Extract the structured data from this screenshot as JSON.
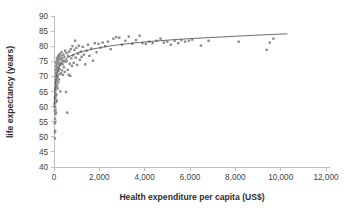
{
  "chart_data": {
    "type": "scatter",
    "title": "",
    "subtitle": "",
    "xlabel": "Health expenditure per capita (US$)",
    "ylabel": "life expectancy (years)",
    "xlim": [
      0,
      12000
    ],
    "ylim": [
      40,
      90
    ],
    "x_ticks": [
      0,
      2000,
      4000,
      6000,
      8000,
      10000,
      12000
    ],
    "x_tick_labels": [
      "0",
      "2,000",
      "4,000",
      "6,000",
      "8,000",
      "10,000",
      "12,000"
    ],
    "y_ticks": [
      40,
      45,
      50,
      55,
      60,
      65,
      70,
      75,
      80,
      85,
      90
    ],
    "y_tick_labels": [
      "40",
      "45",
      "50",
      "55",
      "60",
      "65",
      "70",
      "75",
      "80",
      "85",
      "90"
    ],
    "grid": false,
    "legend": false,
    "legend_position": "none",
    "marker_color": "#8c8c8c",
    "marker_shape": "square",
    "trend_color": "#595959",
    "trend_type": "logarithmic",
    "background_color": "#ffffff",
    "axis_color": "#bfbfbf",
    "series": [
      {
        "name": "countries",
        "points": [
          [
            30,
            61.0
          ],
          [
            32,
            58.5
          ],
          [
            35,
            54.5
          ],
          [
            38,
            63.0
          ],
          [
            40,
            51.5
          ],
          [
            42,
            49.5
          ],
          [
            45,
            56.0
          ],
          [
            48,
            66.0
          ],
          [
            50,
            52.0
          ],
          [
            52,
            60.0
          ],
          [
            55,
            64.5
          ],
          [
            58,
            57.5
          ],
          [
            60,
            68.0
          ],
          [
            62,
            55.0
          ],
          [
            65,
            62.5
          ],
          [
            68,
            70.0
          ],
          [
            70,
            59.0
          ],
          [
            72,
            65.5
          ],
          [
            75,
            72.0
          ],
          [
            78,
            63.5
          ],
          [
            80,
            67.5
          ],
          [
            84,
            71.0
          ],
          [
            86,
            58.0
          ],
          [
            90,
            73.5
          ],
          [
            92,
            61.5
          ],
          [
            95,
            69.0
          ],
          [
            98,
            74.5
          ],
          [
            100,
            66.5
          ],
          [
            105,
            72.5
          ],
          [
            108,
            64.0
          ],
          [
            112,
            70.5
          ],
          [
            115,
            75.0
          ],
          [
            118,
            68.5
          ],
          [
            122,
            73.0
          ],
          [
            126,
            62.0
          ],
          [
            130,
            76.0
          ],
          [
            134,
            71.5
          ],
          [
            138,
            67.0
          ],
          [
            142,
            74.0
          ],
          [
            146,
            69.5
          ],
          [
            150,
            75.5
          ],
          [
            155,
            72.8
          ],
          [
            160,
            66.0
          ],
          [
            165,
            74.8
          ],
          [
            170,
            70.2
          ],
          [
            175,
            76.5
          ],
          [
            180,
            73.2
          ],
          [
            186,
            68.0
          ],
          [
            192,
            75.2
          ],
          [
            198,
            71.8
          ],
          [
            205,
            77.0
          ],
          [
            212,
            74.2
          ],
          [
            220,
            69.0
          ],
          [
            228,
            76.2
          ],
          [
            236,
            72.5
          ],
          [
            245,
            75.8
          ],
          [
            252,
            70.8
          ],
          [
            260,
            77.5
          ],
          [
            270,
            73.8
          ],
          [
            280,
            65.0
          ],
          [
            290,
            76.8
          ],
          [
            300,
            74.5
          ],
          [
            312,
            71.0
          ],
          [
            325,
            75.5
          ],
          [
            338,
            78.0
          ],
          [
            350,
            72.0
          ],
          [
            365,
            76.0
          ],
          [
            380,
            74.0
          ],
          [
            395,
            70.5
          ],
          [
            410,
            77.2
          ],
          [
            425,
            75.0
          ],
          [
            440,
            73.0
          ],
          [
            458,
            76.5
          ],
          [
            475,
            71.5
          ],
          [
            492,
            78.5
          ],
          [
            510,
            74.8
          ],
          [
            530,
            64.8
          ],
          [
            548,
            77.8
          ],
          [
            566,
            75.2
          ],
          [
            585,
            58.0
          ],
          [
            604,
            72.2
          ],
          [
            625,
            76.8
          ],
          [
            648,
            70.5
          ],
          [
            670,
            78.2
          ],
          [
            692,
            74.2
          ],
          [
            715,
            70.2
          ],
          [
            740,
            79.0
          ],
          [
            765,
            76.0
          ],
          [
            790,
            73.5
          ],
          [
            815,
            80.0
          ],
          [
            842,
            77.0
          ],
          [
            870,
            74.5
          ],
          [
            900,
            78.8
          ],
          [
            930,
            81.8
          ],
          [
            960,
            76.2
          ],
          [
            990,
            79.5
          ],
          [
            1020,
            73.8
          ],
          [
            1060,
            77.5
          ],
          [
            1100,
            80.2
          ],
          [
            1140,
            75.5
          ],
          [
            1180,
            78.2
          ],
          [
            1220,
            76.5
          ],
          [
            1270,
            79.8
          ],
          [
            1320,
            77.2
          ],
          [
            1380,
            74.0
          ],
          [
            1440,
            78.5
          ],
          [
            1500,
            80.5
          ],
          [
            1560,
            76.8
          ],
          [
            1640,
            79.2
          ],
          [
            1720,
            75.2
          ],
          [
            1800,
            81.0
          ],
          [
            1880,
            78.0
          ],
          [
            1960,
            80.8
          ],
          [
            2050,
            79.5
          ],
          [
            2150,
            81.2
          ],
          [
            2260,
            80.0
          ],
          [
            2380,
            81.5
          ],
          [
            2500,
            79.0
          ],
          [
            2620,
            82.5
          ],
          [
            2750,
            83.0
          ],
          [
            2880,
            82.8
          ],
          [
            3000,
            80.5
          ],
          [
            3150,
            81.8
          ],
          [
            3300,
            83.2
          ],
          [
            3450,
            80.8
          ],
          [
            3620,
            82.0
          ],
          [
            3780,
            83.5
          ],
          [
            3900,
            81.0
          ],
          [
            4050,
            80.8
          ],
          [
            4200,
            81.5
          ],
          [
            4350,
            81.0
          ],
          [
            4520,
            81.8
          ],
          [
            4700,
            82.5
          ],
          [
            4850,
            81.2
          ],
          [
            5000,
            81.5
          ],
          [
            5150,
            80.5
          ],
          [
            5320,
            81.8
          ],
          [
            5480,
            81.0
          ],
          [
            5620,
            82.0
          ],
          [
            5780,
            81.5
          ],
          [
            5950,
            81.8
          ],
          [
            6100,
            82.2
          ],
          [
            6480,
            80.2
          ],
          [
            6820,
            81.8
          ],
          [
            8150,
            81.5
          ],
          [
            9380,
            78.8
          ],
          [
            9520,
            81.2
          ],
          [
            9680,
            82.5
          ]
        ]
      }
    ],
    "trend_points": [
      [
        10,
        59.5
      ],
      [
        30,
        64.0
      ],
      [
        60,
        67.5
      ],
      [
        100,
        69.8
      ],
      [
        150,
        71.5
      ],
      [
        220,
        73.0
      ],
      [
        320,
        74.3
      ],
      [
        450,
        75.4
      ],
      [
        620,
        76.3
      ],
      [
        850,
        77.2
      ],
      [
        1150,
        78.0
      ],
      [
        1500,
        78.7
      ],
      [
        1950,
        79.4
      ],
      [
        2500,
        80.1
      ],
      [
        3200,
        80.8
      ],
      [
        4000,
        81.4
      ],
      [
        5000,
        82.0
      ],
      [
        6200,
        82.6
      ],
      [
        7500,
        83.1
      ],
      [
        8800,
        83.6
      ],
      [
        10300,
        84.1
      ]
    ]
  }
}
